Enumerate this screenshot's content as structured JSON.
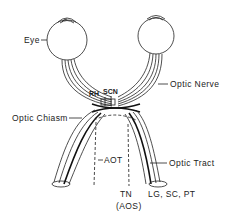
{
  "diagram": {
    "type": "anatomical-schematic",
    "labels": {
      "eye": "Eye",
      "optic_nerve": "Optic Nerve",
      "rh": "RH",
      "scn": "SCN",
      "optic_chiasm": "Optic Chiasm",
      "aot": "AOT",
      "optic_tract": "Optic Tract",
      "tn": "TN",
      "aos": "(AOS)",
      "targets": "LG, SC, PT"
    },
    "colors": {
      "line": "#222222",
      "background": "#ffffff"
    }
  }
}
